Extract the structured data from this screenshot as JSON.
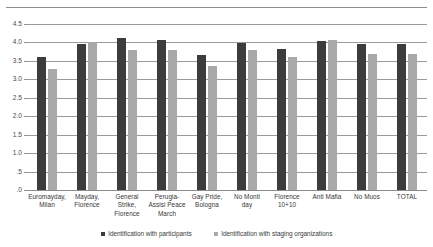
{
  "chart_data": {
    "type": "bar",
    "title": "",
    "subtitle": "",
    "xlabel": "",
    "ylabel": "",
    "ylim": [
      0,
      4.5
    ],
    "ytick_step": 0.5,
    "ytick_labels": [
      "4.5",
      "4.0",
      "3.5",
      "3.0",
      "2.5",
      "2.0",
      "1.5",
      "1.0",
      ".5",
      ".0"
    ],
    "ytick_values": [
      4.5,
      4.0,
      3.5,
      3.0,
      2.5,
      2.0,
      1.5,
      1.0,
      0.5,
      0.0
    ],
    "grid": true,
    "legend_position": "bottom",
    "categories": [
      "Euromayday, Milan",
      "Mayday, Florence",
      "General Strike, Florence",
      "Perugia-Assisi Peace March",
      "Gay Pride, Bologna",
      "No Monti day",
      "Florence 10+10",
      "Anti Mafia",
      "No Muos",
      "TOTAL"
    ],
    "series": [
      {
        "name": "Identification with participants",
        "color": "#3c3c3c",
        "values": [
          3.6,
          3.97,
          4.13,
          4.08,
          3.67,
          3.99,
          3.83,
          4.05,
          3.96,
          3.95
        ]
      },
      {
        "name": "Identification with staging organizations",
        "color": "#a9a9a9",
        "values": [
          3.28,
          4.0,
          3.79,
          3.79,
          3.36,
          3.79,
          3.61,
          4.06,
          3.7,
          3.68
        ]
      }
    ]
  },
  "legend": {
    "items": [
      {
        "label": "Identification with participants",
        "swatch": "series-a"
      },
      {
        "label": "Identification with staging organizations",
        "swatch": "series-b"
      }
    ]
  }
}
